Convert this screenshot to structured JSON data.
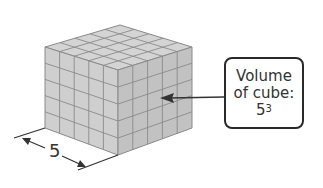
{
  "diagram": {
    "cube": {
      "units_per_edge": 5,
      "face_colors": {
        "top": "#d4d4d4",
        "left": "#cfcfcf",
        "right": "#c2c2c2"
      },
      "grid_color": "#8a8a8a"
    },
    "dimension_label": "5",
    "callout": {
      "line1": "Volume",
      "line2": "of cube:",
      "base": "5",
      "exponent": "3"
    }
  }
}
